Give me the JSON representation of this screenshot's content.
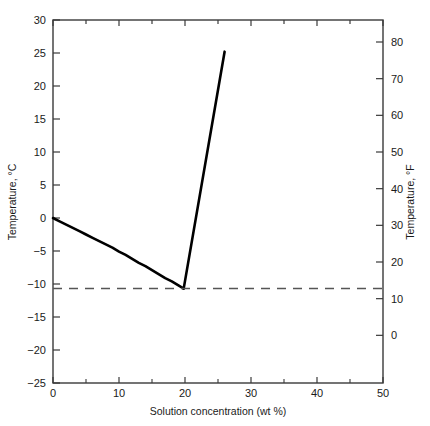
{
  "chart_data": {
    "type": "line",
    "title": "",
    "subtitle": "",
    "xlabel": "Solution concentration (wt %)",
    "ylabel": "Temperature, °C",
    "y2label": "Temperature, °F",
    "xlim": [
      0,
      50
    ],
    "ylim": [
      -25,
      30
    ],
    "y2lim": [
      -13,
      86
    ],
    "grid": false,
    "legend": null,
    "x_ticks": [
      0,
      10,
      20,
      30,
      40,
      50
    ],
    "x_tick_labels": [
      "0",
      "10",
      "20",
      "30",
      "40",
      "50"
    ],
    "x_minor_ticks": [
      5,
      15,
      25,
      35,
      45
    ],
    "y_ticks": [
      -25,
      -20,
      -15,
      -10,
      -5,
      0,
      5,
      10,
      15,
      20,
      25,
      30
    ],
    "y_tick_labels": [
      "−25",
      "−20",
      "−15",
      "−10",
      "−5",
      "0",
      "5",
      "10",
      "15",
      "20",
      "25",
      "30"
    ],
    "y2_ticks": [
      0,
      10,
      20,
      30,
      40,
      50,
      60,
      70,
      80
    ],
    "y2_tick_labels": [
      "0",
      "10",
      "20",
      "30",
      "40",
      "50",
      "60",
      "70",
      "80"
    ],
    "series": [
      {
        "name": "liquidus-freezing-point-depression",
        "style": "solid",
        "color": "#000000",
        "width": 2.6,
        "points": [
          [
            0.0,
            0.0
          ],
          [
            1.0,
            -0.5
          ],
          [
            2.0,
            -1.0
          ],
          [
            3.0,
            -1.5
          ],
          [
            4.0,
            -2.0
          ],
          [
            5.0,
            -2.5
          ],
          [
            6.0,
            -3.0
          ],
          [
            7.0,
            -3.5
          ],
          [
            8.0,
            -4.0
          ],
          [
            9.0,
            -4.5
          ],
          [
            10.0,
            -5.1
          ],
          [
            11.0,
            -5.6
          ],
          [
            12.0,
            -6.2
          ],
          [
            13.0,
            -6.8
          ],
          [
            14.0,
            -7.3
          ],
          [
            15.0,
            -7.9
          ],
          [
            16.0,
            -8.5
          ],
          [
            17.0,
            -9.1
          ],
          [
            18.0,
            -9.6
          ],
          [
            19.0,
            -10.2
          ],
          [
            19.5,
            -10.5
          ],
          [
            19.8,
            -10.7
          ]
        ]
      },
      {
        "name": "solidus-ice-salt-branch",
        "style": "solid",
        "color": "#000000",
        "width": 2.6,
        "points": [
          [
            19.8,
            -10.7
          ],
          [
            26.0,
            25.2
          ]
        ]
      },
      {
        "name": "eutectic-isotherm",
        "style": "dashed",
        "color": "#555555",
        "width": 1.5,
        "points": [
          [
            0.0,
            -10.7
          ],
          [
            50.0,
            -10.7
          ]
        ]
      }
    ],
    "annotations": {
      "eutectic_point": {
        "x": 19.8,
        "y_c": -10.7,
        "y_f": 12.7
      }
    }
  },
  "figure": {
    "background": "#ffffff",
    "frame_color": "#3a3a3a",
    "axis_text_color": "#1a1a1a"
  }
}
